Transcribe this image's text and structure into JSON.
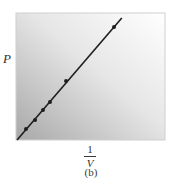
{
  "chart_data": {
    "type": "line",
    "title": "",
    "caption": "(b)",
    "xlabel": {
      "numerator": "1",
      "denominator": "V",
      "text": "1/V"
    },
    "ylabel": "P",
    "xlim": [
      0,
      1
    ],
    "ylim": [
      0,
      1
    ],
    "grid": false,
    "legend": null,
    "tick_labels": {
      "x": [],
      "y": []
    },
    "series": [
      {
        "name": "P vs 1/V",
        "style": "line-with-markers",
        "line": {
          "x": [
            0.007,
            0.71
          ],
          "y": [
            0.0,
            0.96
          ]
        },
        "points": {
          "x": [
            0.067,
            0.128,
            0.181,
            0.228,
            0.336,
            0.658
          ],
          "y": [
            0.087,
            0.157,
            0.236,
            0.299,
            0.465,
            0.89
          ]
        }
      }
    ],
    "colors": {
      "background_gradient_dark": "#a8a8a8",
      "background_gradient_light": "#ffffff",
      "line": "#1e1e1e",
      "marker": "#1e1e1e",
      "frame": "#cfcfcf"
    }
  }
}
